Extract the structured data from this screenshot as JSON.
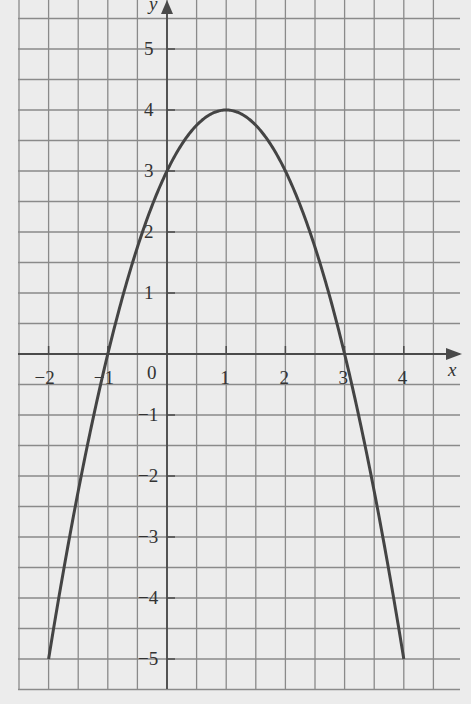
{
  "chart_data": {
    "type": "line",
    "title": "",
    "xlabel": "x",
    "ylabel": "y",
    "function": "y = -x^2 + 2x + 3",
    "xlim": [
      -2.5,
      4.85
    ],
    "ylim": [
      -5.5,
      5.85
    ],
    "grid": true,
    "grid_step": 0.5,
    "x_ticks": [
      -2,
      -1,
      0,
      1,
      2,
      3,
      4
    ],
    "y_ticks": [
      -5,
      -4,
      -3,
      -2,
      -1,
      1,
      2,
      3,
      4,
      5
    ],
    "x_tick_labels": [
      "−2",
      "−1",
      "0",
      "1",
      "2",
      "3",
      "4"
    ],
    "y_tick_labels": [
      "−5",
      "−4",
      "−3",
      "−2",
      "−1",
      "1",
      "2",
      "3",
      "4",
      "5"
    ],
    "series": [
      {
        "name": "parabola",
        "x": [
          -2,
          -1.5,
          -1,
          -0.5,
          0,
          0.5,
          1,
          1.5,
          2,
          2.5,
          3,
          3.5,
          4
        ],
        "y": [
          -5,
          -2.25,
          0,
          1.75,
          3,
          3.75,
          4,
          3.75,
          3,
          1.75,
          0,
          -2.25,
          -5
        ]
      }
    ],
    "annotations": {
      "vertex": [
        1,
        4
      ],
      "roots": [
        -1,
        3
      ],
      "y_intercept": 3
    },
    "colors": {
      "background": "#ececec",
      "grid": "#8a8a8a",
      "curve": "#444444",
      "axes": "#4a4a4a"
    }
  },
  "labels": {
    "x_axis": "x",
    "y_axis": "y",
    "origin": "0"
  }
}
